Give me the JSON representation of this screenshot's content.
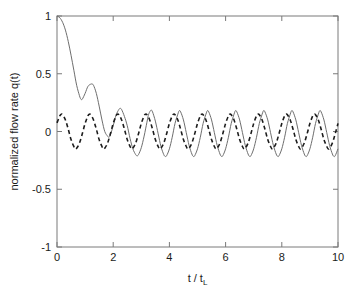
{
  "chart_data": {
    "type": "line",
    "title": "",
    "xlabel": "t / t_L",
    "xlabel_main": "t / t",
    "xlabel_sub": "L",
    "ylabel": "normalized flow rate q(t)",
    "xlim": [
      0,
      10
    ],
    "ylim": [
      -1,
      1
    ],
    "xticks": [
      0,
      2,
      4,
      6,
      8,
      10
    ],
    "xtick_labels": [
      "0",
      "2",
      "4",
      "6",
      "8",
      "10"
    ],
    "yticks": [
      -1,
      -0.5,
      0,
      0.5,
      1
    ],
    "ytick_labels": [
      "-1",
      "-0.5",
      "0",
      "0.5",
      "1"
    ],
    "grid": false,
    "legend": "none",
    "box": true,
    "series": [
      {
        "name": "transient solution",
        "style": "solid",
        "color": "#6e6e6e",
        "description": "Starts at q=1, decays with superposed oscillation to a steady oscillation of amplitude ~0.22 about 0",
        "model": {
          "form": "steady + transient",
          "steady_amplitude": 0.22,
          "steady_period": 1.0,
          "steady_phase_deg": 90,
          "transient_initial": 1.0,
          "transient_decay_time": 0.62
        },
        "points": [
          [
            0.0,
            1.0
          ],
          [
            0.1,
            0.985
          ],
          [
            0.2,
            0.945
          ],
          [
            0.3,
            0.878
          ],
          [
            0.4,
            0.78
          ],
          [
            0.5,
            0.66
          ],
          [
            0.6,
            0.53
          ],
          [
            0.7,
            0.4
          ],
          [
            0.8,
            0.31
          ],
          [
            0.85,
            0.28
          ],
          [
            0.9,
            0.28
          ],
          [
            1.0,
            0.33
          ],
          [
            1.1,
            0.39
          ],
          [
            1.2,
            0.41
          ],
          [
            1.25,
            0.41
          ],
          [
            1.3,
            0.4
          ],
          [
            1.4,
            0.33
          ],
          [
            1.5,
            0.22
          ],
          [
            1.6,
            0.1
          ],
          [
            1.7,
            0.0
          ],
          [
            1.8,
            -0.04
          ],
          [
            1.85,
            -0.05
          ],
          [
            1.9,
            -0.03
          ],
          [
            2.0,
            0.05
          ],
          [
            2.1,
            0.14
          ],
          [
            2.2,
            0.19
          ],
          [
            2.25,
            0.2
          ],
          [
            2.3,
            0.19
          ],
          [
            2.4,
            0.13
          ],
          [
            2.5,
            0.05
          ],
          [
            2.6,
            -0.06
          ],
          [
            2.7,
            -0.15
          ],
          [
            2.8,
            -0.2
          ],
          [
            2.85,
            -0.21
          ],
          [
            2.9,
            -0.2
          ],
          [
            3.0,
            -0.14
          ],
          [
            3.1,
            -0.04
          ],
          [
            3.2,
            0.08
          ],
          [
            3.25,
            0.14
          ],
          [
            3.3,
            0.17
          ],
          [
            3.35,
            0.185
          ],
          [
            3.4,
            0.17
          ],
          [
            3.5,
            0.09
          ],
          [
            3.6,
            -0.02
          ],
          [
            3.7,
            -0.13
          ],
          [
            3.8,
            -0.2
          ],
          [
            3.85,
            -0.215
          ],
          [
            3.9,
            -0.21
          ],
          [
            4.0,
            -0.15
          ],
          [
            4.1,
            -0.05
          ],
          [
            4.2,
            0.07
          ],
          [
            4.3,
            0.15
          ],
          [
            4.35,
            0.18
          ],
          [
            4.4,
            0.17
          ],
          [
            4.5,
            0.1
          ],
          [
            4.6,
            -0.01
          ],
          [
            4.7,
            -0.12
          ],
          [
            4.8,
            -0.195
          ],
          [
            4.85,
            -0.215
          ],
          [
            4.9,
            -0.21
          ],
          [
            5.0,
            -0.15
          ],
          [
            5.1,
            -0.05
          ],
          [
            5.2,
            0.07
          ],
          [
            5.3,
            0.15
          ],
          [
            5.35,
            0.18
          ],
          [
            5.4,
            0.17
          ],
          [
            5.5,
            0.1
          ],
          [
            5.6,
            -0.01
          ],
          [
            5.7,
            -0.12
          ],
          [
            5.8,
            -0.195
          ],
          [
            5.85,
            -0.215
          ],
          [
            5.9,
            -0.21
          ],
          [
            6.0,
            -0.15
          ],
          [
            6.1,
            -0.05
          ],
          [
            6.2,
            0.07
          ],
          [
            6.3,
            0.15
          ],
          [
            6.35,
            0.18
          ],
          [
            6.4,
            0.17
          ],
          [
            6.5,
            0.1
          ],
          [
            6.6,
            -0.01
          ],
          [
            6.7,
            -0.12
          ],
          [
            6.8,
            -0.195
          ],
          [
            6.85,
            -0.215
          ],
          [
            6.9,
            -0.21
          ],
          [
            7.0,
            -0.15
          ],
          [
            7.1,
            -0.05
          ],
          [
            7.2,
            0.07
          ],
          [
            7.3,
            0.15
          ],
          [
            7.35,
            0.18
          ],
          [
            7.4,
            0.17
          ],
          [
            7.5,
            0.1
          ],
          [
            7.6,
            -0.01
          ],
          [
            7.7,
            -0.12
          ],
          [
            7.8,
            -0.195
          ],
          [
            7.85,
            -0.215
          ],
          [
            7.9,
            -0.21
          ],
          [
            8.0,
            -0.15
          ],
          [
            8.1,
            -0.05
          ],
          [
            8.2,
            0.07
          ],
          [
            8.3,
            0.15
          ],
          [
            8.35,
            0.18
          ],
          [
            8.4,
            0.17
          ],
          [
            8.5,
            0.1
          ],
          [
            8.6,
            -0.01
          ],
          [
            8.7,
            -0.12
          ],
          [
            8.8,
            -0.195
          ],
          [
            8.85,
            -0.215
          ],
          [
            8.9,
            -0.21
          ],
          [
            9.0,
            -0.15
          ],
          [
            9.1,
            -0.05
          ],
          [
            9.2,
            0.07
          ],
          [
            9.3,
            0.15
          ],
          [
            9.35,
            0.18
          ],
          [
            9.4,
            0.17
          ],
          [
            9.5,
            0.1
          ],
          [
            9.6,
            -0.01
          ],
          [
            9.7,
            -0.12
          ],
          [
            9.8,
            -0.195
          ],
          [
            9.85,
            -0.215
          ],
          [
            9.9,
            -0.21
          ],
          [
            10.0,
            -0.15
          ]
        ]
      },
      {
        "name": "steady-state solution",
        "style": "dashed",
        "color": "#1c1c1c",
        "description": "Pure sinusoidal oscillation of amplitude ~0.15 and period 1.0 about 0",
        "model": {
          "form": "sinusoid",
          "amplitude": 0.15,
          "period": 1.0,
          "phase_deg": 120,
          "offset": 0.0
        },
        "points": [
          [
            0.0,
            0.075
          ],
          [
            0.1,
            0.135
          ],
          [
            0.15,
            0.15
          ],
          [
            0.2,
            0.145
          ],
          [
            0.3,
            0.1
          ],
          [
            0.4,
            0.02
          ],
          [
            0.5,
            -0.07
          ],
          [
            0.6,
            -0.13
          ],
          [
            0.65,
            -0.15
          ],
          [
            0.7,
            -0.145
          ],
          [
            0.8,
            -0.1
          ],
          [
            0.9,
            -0.02
          ],
          [
            1.0,
            0.07
          ],
          [
            1.1,
            0.135
          ],
          [
            1.15,
            0.15
          ],
          [
            1.2,
            0.145
          ],
          [
            1.3,
            0.1
          ],
          [
            1.4,
            0.02
          ],
          [
            1.5,
            -0.07
          ],
          [
            1.6,
            -0.13
          ],
          [
            1.65,
            -0.15
          ],
          [
            1.7,
            -0.145
          ],
          [
            1.8,
            -0.1
          ],
          [
            1.9,
            -0.02
          ],
          [
            2.0,
            0.07
          ],
          [
            2.1,
            0.135
          ],
          [
            2.15,
            0.15
          ],
          [
            2.2,
            0.145
          ],
          [
            2.3,
            0.1
          ],
          [
            2.4,
            0.02
          ],
          [
            2.5,
            -0.07
          ],
          [
            2.6,
            -0.13
          ],
          [
            2.65,
            -0.15
          ],
          [
            2.7,
            -0.145
          ],
          [
            2.8,
            -0.1
          ],
          [
            2.9,
            -0.02
          ],
          [
            3.0,
            0.07
          ],
          [
            3.1,
            0.135
          ],
          [
            3.15,
            0.15
          ],
          [
            3.2,
            0.145
          ],
          [
            3.3,
            0.1
          ],
          [
            3.4,
            0.02
          ],
          [
            3.5,
            -0.07
          ],
          [
            3.6,
            -0.13
          ],
          [
            3.65,
            -0.15
          ],
          [
            3.7,
            -0.145
          ],
          [
            3.8,
            -0.1
          ],
          [
            3.9,
            -0.02
          ],
          [
            4.0,
            0.07
          ],
          [
            4.1,
            0.135
          ],
          [
            4.15,
            0.15
          ],
          [
            4.2,
            0.145
          ],
          [
            4.3,
            0.1
          ],
          [
            4.4,
            0.02
          ],
          [
            4.5,
            -0.07
          ],
          [
            4.6,
            -0.13
          ],
          [
            4.65,
            -0.15
          ],
          [
            4.7,
            -0.145
          ],
          [
            4.8,
            -0.1
          ],
          [
            4.9,
            -0.02
          ],
          [
            5.0,
            0.07
          ],
          [
            5.1,
            0.135
          ],
          [
            5.15,
            0.15
          ],
          [
            5.2,
            0.145
          ],
          [
            5.3,
            0.1
          ],
          [
            5.4,
            0.02
          ],
          [
            5.5,
            -0.07
          ],
          [
            5.6,
            -0.13
          ],
          [
            5.65,
            -0.15
          ],
          [
            5.7,
            -0.145
          ],
          [
            5.8,
            -0.1
          ],
          [
            5.9,
            -0.02
          ],
          [
            6.0,
            0.07
          ],
          [
            6.1,
            0.135
          ],
          [
            6.15,
            0.15
          ],
          [
            6.2,
            0.145
          ],
          [
            6.3,
            0.1
          ],
          [
            6.4,
            0.02
          ],
          [
            6.5,
            -0.07
          ],
          [
            6.6,
            -0.13
          ],
          [
            6.65,
            -0.15
          ],
          [
            6.7,
            -0.145
          ],
          [
            6.8,
            -0.1
          ],
          [
            6.9,
            -0.02
          ],
          [
            7.0,
            0.07
          ],
          [
            7.1,
            0.135
          ],
          [
            7.15,
            0.15
          ],
          [
            7.2,
            0.145
          ],
          [
            7.3,
            0.1
          ],
          [
            7.4,
            0.02
          ],
          [
            7.5,
            -0.07
          ],
          [
            7.6,
            -0.13
          ],
          [
            7.65,
            -0.15
          ],
          [
            7.7,
            -0.145
          ],
          [
            7.8,
            -0.1
          ],
          [
            7.9,
            -0.02
          ],
          [
            8.0,
            0.07
          ],
          [
            8.1,
            0.135
          ],
          [
            8.15,
            0.15
          ],
          [
            8.2,
            0.145
          ],
          [
            8.3,
            0.1
          ],
          [
            8.4,
            0.02
          ],
          [
            8.5,
            -0.07
          ],
          [
            8.6,
            -0.13
          ],
          [
            8.65,
            -0.15
          ],
          [
            8.7,
            -0.145
          ],
          [
            8.8,
            -0.1
          ],
          [
            8.9,
            -0.02
          ],
          [
            9.0,
            0.07
          ],
          [
            9.1,
            0.135
          ],
          [
            9.15,
            0.15
          ],
          [
            9.2,
            0.145
          ],
          [
            9.3,
            0.1
          ],
          [
            9.4,
            0.02
          ],
          [
            9.5,
            -0.07
          ],
          [
            9.6,
            -0.13
          ],
          [
            9.65,
            -0.15
          ],
          [
            9.7,
            -0.145
          ],
          [
            9.8,
            -0.1
          ],
          [
            9.9,
            -0.02
          ],
          [
            10.0,
            0.07
          ]
        ]
      }
    ]
  }
}
